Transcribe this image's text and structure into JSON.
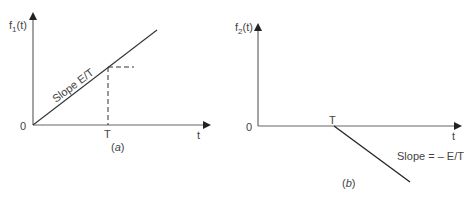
{
  "figure_a": {
    "y_label": "f",
    "y_label_sub": "1",
    "y_label_arg": "(t)",
    "origin_label": "0",
    "t_tick_label": "T",
    "x_label": "t",
    "slope_label": "Slope E/T",
    "caption_open": "(",
    "caption_letter": "a",
    "caption_close": ")"
  },
  "figure_b": {
    "y_label": "f",
    "y_label_sub": "2",
    "y_label_arg": "(t)",
    "origin_label": "0",
    "t_tick_label": "T",
    "x_label": "t",
    "slope_label": "Slope = – E/T",
    "caption_open": "(",
    "caption_letter": "b",
    "caption_close": ")"
  },
  "colors": {
    "axis": "#555555",
    "line": "#333333",
    "text": "#444444"
  }
}
